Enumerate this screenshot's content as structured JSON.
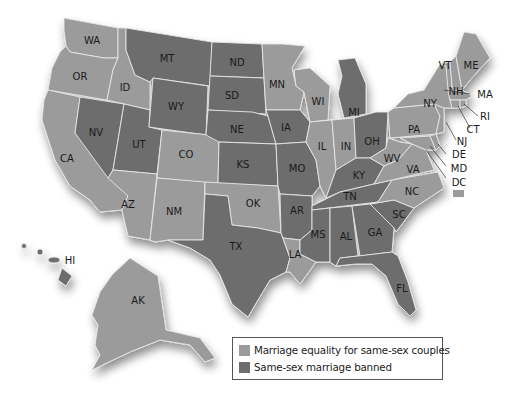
{
  "colors": {
    "equality": "#9b9b9b",
    "banned": "#6d6d6d",
    "border": "#e6e6e6",
    "background": "#ffffff"
  },
  "legend": {
    "items": [
      {
        "key": "equality",
        "label": "Marriage equality for same-sex couples",
        "color": "#9b9b9b"
      },
      {
        "key": "banned",
        "label": "Same-sex marriage banned",
        "color": "#6d6d6d"
      }
    ]
  },
  "states": {
    "WA": "equality",
    "OR": "equality",
    "CA": "equality",
    "ID": "equality",
    "NV": "banned",
    "UT": "banned",
    "AZ": "equality",
    "MT": "banned",
    "WY": "banned",
    "CO": "equality",
    "NM": "equality",
    "ND": "banned",
    "SD": "banned",
    "NE": "banned",
    "KS": "banned",
    "OK": "equality",
    "TX": "banned",
    "MN": "equality",
    "IA": "banned",
    "MO": "banned",
    "AR": "banned",
    "LA": "equality",
    "WI": "equality",
    "IL": "equality",
    "MI": "banned",
    "IN": "equality",
    "OH": "banned",
    "KY": "banned",
    "TN": "banned",
    "MS": "banned",
    "AL": "banned",
    "GA": "banned",
    "FL": "banned",
    "SC": "banned",
    "NC": "equality",
    "VA": "equality",
    "WV": "equality",
    "PA": "equality",
    "NY": "equality",
    "VT": "equality",
    "NH": "equality",
    "ME": "equality",
    "MA": "equality",
    "RI": "equality",
    "CT": "equality",
    "NJ": "equality",
    "DE": "equality",
    "MD": "equality",
    "DC": "equality",
    "AK": "equality",
    "HI": "banned"
  },
  "labels": {
    "WA": "WA",
    "OR": "OR",
    "CA": "CA",
    "ID": "ID",
    "NV": "NV",
    "UT": "UT",
    "AZ": "AZ",
    "MT": "MT",
    "WY": "WY",
    "CO": "CO",
    "NM": "NM",
    "ND": "ND",
    "SD": "SD",
    "NE": "NE",
    "KS": "KS",
    "OK": "OK",
    "TX": "TX",
    "MN": "MN",
    "IA": "IA",
    "MO": "MO",
    "AR": "AR",
    "LA": "LA",
    "WI": "WI",
    "IL": "IL",
    "MI": "MI",
    "IN": "IN",
    "OH": "OH",
    "KY": "KY",
    "TN": "TN",
    "MS": "MS",
    "AL": "AL",
    "GA": "GA",
    "FL": "FL",
    "SC": "SC",
    "NC": "NC",
    "VA": "VA",
    "WV": "WV",
    "PA": "PA",
    "NY": "NY",
    "VT": "VT",
    "NH": "NH",
    "ME": "ME",
    "MA": "MA",
    "RI": "RI",
    "CT": "CT",
    "NJ": "NJ",
    "DE": "DE",
    "MD": "MD",
    "DC": "DC",
    "AK": "AK",
    "HI": "HI"
  }
}
